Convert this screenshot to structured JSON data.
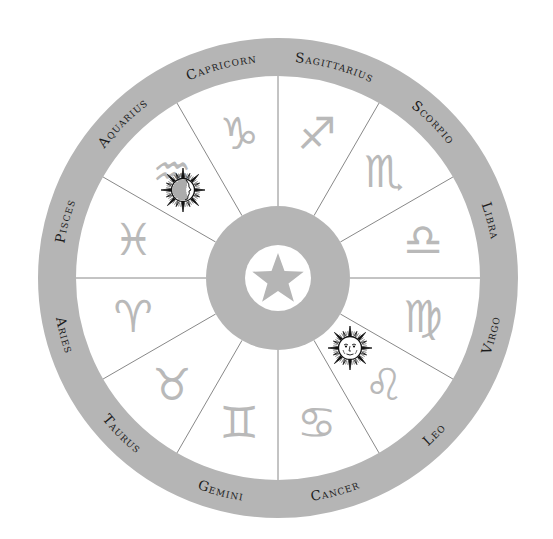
{
  "diagram": {
    "colors": {
      "ring": "#b5b5b5",
      "glyph": "#b9b9b9",
      "label": "#1c1c1c",
      "divider": "#6a6a6a",
      "background": "#ffffff",
      "sun_ink": "#111111"
    },
    "center_icon": "star-icon",
    "signs": [
      {
        "name": "Sagittarius",
        "symbol": "♐",
        "label": "Sagittarius",
        "icon": "sagittarius-icon"
      },
      {
        "name": "Scorpio",
        "symbol": "♏",
        "label": "Scorpio",
        "icon": "scorpio-icon"
      },
      {
        "name": "Libra",
        "symbol": "♎",
        "label": "Libra",
        "icon": "libra-icon"
      },
      {
        "name": "Virgo",
        "symbol": "♍",
        "label": "Virgo",
        "icon": "virgo-icon"
      },
      {
        "name": "Leo",
        "symbol": "♌",
        "label": "Leo",
        "icon": "leo-icon"
      },
      {
        "name": "Cancer",
        "symbol": "♋",
        "label": "Cancer",
        "icon": "cancer-icon"
      },
      {
        "name": "Gemini",
        "symbol": "♊",
        "label": "Gemini",
        "icon": "gemini-icon"
      },
      {
        "name": "Taurus",
        "symbol": "♉",
        "label": "Taurus",
        "icon": "taurus-icon"
      },
      {
        "name": "Aries",
        "symbol": "♈",
        "label": "Aries",
        "icon": "aries-icon"
      },
      {
        "name": "Pisces",
        "symbol": "♓",
        "label": "Pisces",
        "icon": "pisces-icon"
      },
      {
        "name": "Aquarius",
        "symbol": "♒",
        "label": "Aquarius",
        "icon": "aquarius-icon"
      },
      {
        "name": "Capricorn",
        "symbol": "♑",
        "label": "Capricorn",
        "icon": "capricorn-icon"
      }
    ],
    "markers": [
      {
        "name": "sun-profile-face-icon",
        "sign": "Aquarius"
      },
      {
        "name": "sun-face-icon",
        "sign": "Leo"
      }
    ]
  }
}
